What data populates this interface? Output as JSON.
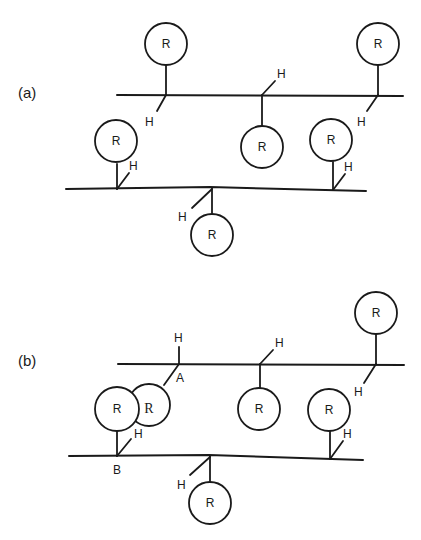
{
  "figure": {
    "panels": [
      {
        "label": "(a)",
        "chains": [
          "upper-chain",
          "lower-chain"
        ],
        "side_groups": [
          {
            "name": "R",
            "position": "upper-chain-left-up"
          },
          {
            "name": "H",
            "position": "upper-chain-left-down"
          },
          {
            "name": "H",
            "position": "upper-chain-center-up"
          },
          {
            "name": "R",
            "position": "upper-chain-center-down"
          },
          {
            "name": "R",
            "position": "upper-chain-right-up"
          },
          {
            "name": "H",
            "position": "upper-chain-right-down"
          },
          {
            "name": "R",
            "position": "lower-chain-left-up"
          },
          {
            "name": "H",
            "position": "lower-chain-left-up"
          },
          {
            "name": "H",
            "position": "lower-chain-center-down"
          },
          {
            "name": "R",
            "position": "lower-chain-center-down"
          },
          {
            "name": "R",
            "position": "lower-chain-right-up"
          },
          {
            "name": "H",
            "position": "lower-chain-right-up"
          }
        ]
      },
      {
        "label": "(b)",
        "junction_labels": [
          "A",
          "B"
        ],
        "chains": [
          "upper-chain",
          "lower-chain"
        ],
        "side_groups": [
          {
            "name": "H",
            "position": "upper-chain-A-up"
          },
          {
            "name": "R",
            "position": "upper-chain-A-down (serif, overlapping)"
          },
          {
            "name": "H",
            "position": "upper-chain-center-up"
          },
          {
            "name": "R",
            "position": "upper-chain-center-down"
          },
          {
            "name": "R",
            "position": "upper-chain-right-up"
          },
          {
            "name": "H",
            "position": "upper-chain-right-down"
          },
          {
            "name": "R",
            "position": "lower-chain-B-up"
          },
          {
            "name": "H",
            "position": "lower-chain-B-up"
          },
          {
            "name": "H",
            "position": "lower-chain-center-down"
          },
          {
            "name": "R",
            "position": "lower-chain-center-down"
          },
          {
            "name": "R",
            "position": "lower-chain-right-up"
          },
          {
            "name": "H",
            "position": "lower-chain-right-up"
          }
        ]
      }
    ],
    "labels": {
      "R": "R",
      "H": "H",
      "A": "A",
      "B": "B",
      "panel_a": "(a)",
      "panel_b": "(b)"
    }
  }
}
